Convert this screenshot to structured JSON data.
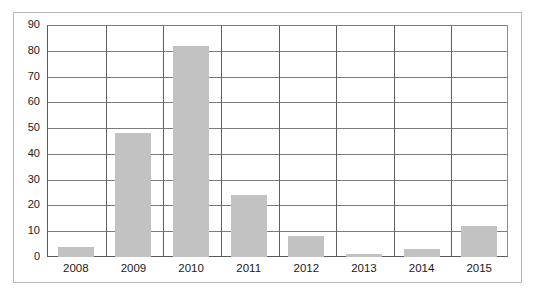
{
  "chart_data": {
    "type": "bar",
    "title": "",
    "subtitle": "",
    "xlabel": "",
    "ylabel": "",
    "categories": [
      "2008",
      "2009",
      "2010",
      "2011",
      "2012",
      "2013",
      "2014",
      "2015"
    ],
    "values": [
      4,
      48,
      82,
      24,
      8,
      1,
      3,
      12
    ],
    "ylim": [
      0,
      90
    ],
    "ytick_labels": [
      "0",
      "10",
      "20",
      "30",
      "40",
      "50",
      "60",
      "70",
      "80",
      "90"
    ],
    "ytick_values": [
      0,
      10,
      20,
      30,
      40,
      50,
      60,
      70,
      80,
      90
    ],
    "grid": "horizontal-and-vertical",
    "legend": "none",
    "bar_color": "#c2c2c2",
    "axis_color": "#5a5a5a",
    "gridline_color": "#7d7d7d",
    "text_color": "#1a1a1a",
    "frame_color": "#b9b9b9",
    "background_color": "#ffffff"
  }
}
